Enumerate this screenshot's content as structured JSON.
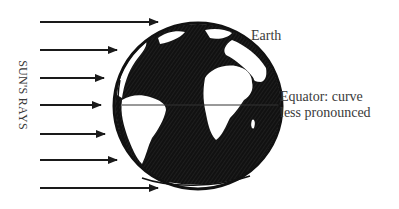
{
  "diagram": {
    "labels": {
      "sun_rays": "SUN'S RAYS",
      "earth": "Earth",
      "equator_line1": "Equator: curve",
      "equator_line2": "less pronounced"
    },
    "colors": {
      "ink": "#1a1a1a",
      "text": "#3a3a3a",
      "background": "#ffffff"
    },
    "arrows": [
      {
        "y": 22,
        "x1": 40,
        "x2": 158
      },
      {
        "y": 50,
        "x1": 40,
        "x2": 117
      },
      {
        "y": 78,
        "x1": 40,
        "x2": 104
      },
      {
        "y": 105,
        "x1": 40,
        "x2": 101
      },
      {
        "y": 134,
        "x1": 40,
        "x2": 105
      },
      {
        "y": 160,
        "x1": 40,
        "x2": 117
      },
      {
        "y": 188,
        "x1": 40,
        "x2": 158
      }
    ],
    "globe": {
      "cx": 198,
      "cy": 106,
      "rx": 85,
      "ry": 84
    },
    "equator": {
      "y": 105,
      "x1": 122,
      "x2": 278
    }
  }
}
